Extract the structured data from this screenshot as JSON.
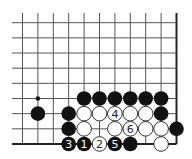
{
  "diagram": {
    "type": "go-board-fragment",
    "grid": {
      "columns": 11,
      "rows": 9,
      "origin_x": 22.5,
      "origin_y": 22.7,
      "spacing_x": 15.4,
      "spacing_y": 15.16,
      "left_extent": 12,
      "top_extent": 13,
      "right_edge": true,
      "bottom_edge": true,
      "line_color": "#555555",
      "edge_color": "#222222"
    },
    "star_points": [
      {
        "col": 1,
        "row": 5
      }
    ],
    "stone_radius": 7.3,
    "colors": {
      "black": "#111111",
      "white": "#ffffff",
      "white_stroke": "#333333",
      "label_on_black": "#ffffff",
      "label_on_white": "#222222"
    },
    "stones": [
      {
        "col": 4,
        "row": 5,
        "color": "black",
        "label": ""
      },
      {
        "col": 5,
        "row": 5,
        "color": "black",
        "label": ""
      },
      {
        "col": 6,
        "row": 5,
        "color": "black",
        "label": ""
      },
      {
        "col": 7,
        "row": 5,
        "color": "black",
        "label": ""
      },
      {
        "col": 8,
        "row": 5,
        "color": "black",
        "label": ""
      },
      {
        "col": 9,
        "row": 5,
        "color": "black",
        "label": ""
      },
      {
        "col": 1,
        "row": 6,
        "color": "black",
        "label": ""
      },
      {
        "col": 3,
        "row": 6,
        "color": "black",
        "label": ""
      },
      {
        "col": 4,
        "row": 6,
        "color": "white",
        "label": ""
      },
      {
        "col": 5,
        "row": 6,
        "color": "white",
        "label": ""
      },
      {
        "col": 6,
        "row": 6,
        "color": "white",
        "label": "4"
      },
      {
        "col": 7,
        "row": 6,
        "color": "white",
        "label": ""
      },
      {
        "col": 8,
        "row": 6,
        "color": "white",
        "label": ""
      },
      {
        "col": 9,
        "row": 6,
        "color": "black",
        "label": ""
      },
      {
        "col": 3,
        "row": 7,
        "color": "black",
        "label": ""
      },
      {
        "col": 4,
        "row": 7,
        "color": "white",
        "label": ""
      },
      {
        "col": 6,
        "row": 7,
        "color": "white",
        "label": ""
      },
      {
        "col": 7,
        "row": 7,
        "color": "white",
        "label": "6"
      },
      {
        "col": 8,
        "row": 7,
        "color": "white",
        "label": ""
      },
      {
        "col": 9,
        "row": 7,
        "color": "white",
        "label": ""
      },
      {
        "col": 10,
        "row": 7,
        "color": "black",
        "label": ""
      },
      {
        "col": 3,
        "row": 8,
        "color": "black",
        "label": "3"
      },
      {
        "col": 4,
        "row": 8,
        "color": "black",
        "label": "1"
      },
      {
        "col": 5,
        "row": 8,
        "color": "white",
        "label": "2"
      },
      {
        "col": 6,
        "row": 8,
        "color": "black",
        "label": "5"
      },
      {
        "col": 7,
        "row": 8,
        "color": "black",
        "label": ""
      },
      {
        "col": 9,
        "row": 8,
        "color": "white",
        "label": ""
      }
    ]
  }
}
